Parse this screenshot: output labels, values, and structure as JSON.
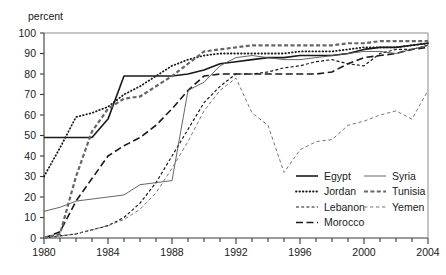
{
  "chart_data": {
    "type": "line",
    "title": "",
    "subtitle": "",
    "ylabel": "percent",
    "xlabel": "",
    "ylim": [
      0,
      100
    ],
    "xlim": [
      1980,
      2004
    ],
    "ytick_step": 10,
    "yticks": [
      0,
      10,
      20,
      30,
      40,
      50,
      60,
      70,
      80,
      90,
      100
    ],
    "xticks_labeled": [
      1980,
      1984,
      1988,
      1992,
      1996,
      2000,
      2004
    ],
    "xtick_minor_step": 1,
    "grid": false,
    "legend_position": "bottom-right",
    "x": [
      1980,
      1981,
      1982,
      1983,
      1984,
      1985,
      1986,
      1987,
      1988,
      1989,
      1990,
      1991,
      1992,
      1993,
      1994,
      1995,
      1996,
      1997,
      1998,
      1999,
      2000,
      2001,
      2002,
      2003,
      2004
    ],
    "series": [
      {
        "name": "Egypt",
        "style": "solid-thick",
        "color": "#1a1a1a",
        "values": [
          49,
          49,
          49,
          49,
          58,
          79,
          79,
          79,
          79,
          80,
          82,
          85,
          86,
          87,
          88,
          88,
          89,
          89,
          89,
          90,
          92,
          93,
          93,
          94,
          95
        ]
      },
      {
        "name": "Jordan",
        "style": "dotted",
        "color": "#1a1a1a",
        "values": [
          30,
          44,
          59,
          61,
          64,
          70,
          74,
          79,
          84,
          87,
          89,
          90,
          90,
          90,
          90,
          90,
          91,
          91,
          91,
          92,
          93,
          93,
          93,
          94,
          95
        ]
      },
      {
        "name": "Lebanon",
        "style": "dash-short",
        "color": "#1a1a1a",
        "values": [
          0,
          1,
          2,
          4,
          6,
          10,
          17,
          27,
          40,
          53,
          66,
          74,
          80,
          80,
          81,
          83,
          84,
          86,
          87,
          85,
          84,
          90,
          92,
          92,
          94
        ]
      },
      {
        "name": "Morocco",
        "style": "dash-long",
        "color": "#1a1a1a",
        "values": [
          0,
          3,
          18,
          29,
          40,
          45,
          49,
          55,
          63,
          72,
          79,
          80,
          80,
          80,
          80,
          80,
          80,
          80,
          81,
          85,
          88,
          89,
          90,
          92,
          93
        ]
      },
      {
        "name": "Syria",
        "style": "solid-thin",
        "color": "#555555",
        "values": [
          13,
          15,
          18,
          19,
          20,
          21,
          26,
          27,
          28,
          72,
          76,
          84,
          88,
          89,
          88,
          87,
          87,
          88,
          89,
          90,
          91,
          91,
          90,
          92,
          94
        ]
      },
      {
        "name": "Tunisia",
        "style": "dash-thick-gray",
        "color": "#666666",
        "values": [
          0,
          2,
          30,
          52,
          63,
          68,
          69,
          74,
          79,
          85,
          91,
          92,
          93,
          94,
          94,
          94,
          94,
          94,
          94,
          95,
          95,
          96,
          96,
          96,
          96
        ]
      },
      {
        "name": "Yemen",
        "style": "dash-thin-gray",
        "color": "#777777",
        "values": [
          0,
          1,
          2,
          4,
          6,
          9,
          14,
          22,
          34,
          47,
          62,
          72,
          78,
          61,
          55,
          32,
          43,
          47,
          48,
          55,
          57,
          60,
          62,
          58,
          72
        ]
      }
    ]
  },
  "legend": {
    "column_left": [
      "Egypt",
      "Jordan",
      "Lebanon",
      "Morocco"
    ],
    "column_right": [
      "Syria",
      "Tunisia",
      "Yemen"
    ]
  }
}
